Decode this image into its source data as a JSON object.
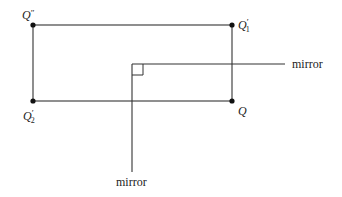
{
  "diagram": {
    "points": {
      "q_double_prime": {
        "label": "Q",
        "mark": "″",
        "sub": ""
      },
      "q1_prime": {
        "label": "Q",
        "mark": "′",
        "sub": "1"
      },
      "q2_prime": {
        "label": "Q",
        "mark": "′",
        "sub": "2"
      },
      "q": {
        "label": "Q",
        "mark": "",
        "sub": ""
      }
    },
    "mirrors": {
      "horizontal_label": "mirror",
      "vertical_label": "mirror"
    },
    "colors": {
      "line": "#333333",
      "point": "#111111"
    }
  }
}
